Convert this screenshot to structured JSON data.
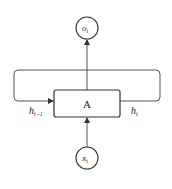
{
  "diagram": {
    "type": "rnn-cell",
    "nodes": {
      "output": {
        "label": "o",
        "subscript": "t"
      },
      "cell": {
        "label": "A"
      },
      "input": {
        "label": "x",
        "subscript": "t"
      }
    },
    "edges": {
      "hidden_in": {
        "label": "h",
        "subscript": "t−1"
      },
      "hidden_out": {
        "label": "h",
        "subscript": "t"
      }
    },
    "colors": {
      "stroke": "#444444",
      "text": "#222222",
      "background": "#ffffff"
    }
  }
}
